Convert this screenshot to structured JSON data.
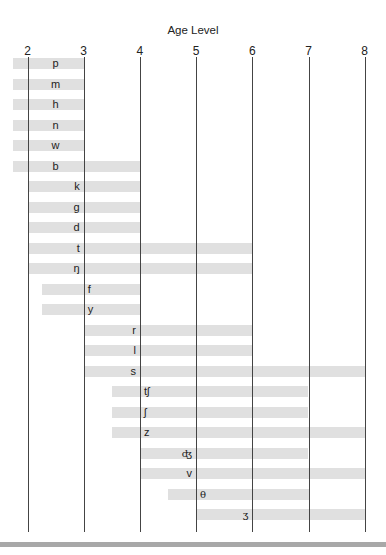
{
  "chart_data": {
    "type": "bar",
    "orientation": "horizontal-range",
    "title": "Age Level",
    "xlabel": "Age Level",
    "ylabel": "",
    "xlim": [
      1.75,
      8
    ],
    "x_ticks": [
      2,
      3,
      4,
      5,
      6,
      7,
      8
    ],
    "grid": "vertical lines at each tick",
    "legend": null,
    "bar_color": "#e0e0e0",
    "line_color": "#444444",
    "categories": [
      "p",
      "m",
      "h",
      "n",
      "w",
      "b",
      "k",
      "g",
      "d",
      "t",
      "ŋ",
      "f",
      "y",
      "r",
      "l",
      "s",
      "tʃ",
      "ʃ",
      "z",
      "ʤ",
      "v",
      "θ",
      "ʒ"
    ],
    "series": [
      {
        "name": "p",
        "start": 1.75,
        "end": 3,
        "label_x": 2.5,
        "label_align": "center"
      },
      {
        "name": "m",
        "start": 1.75,
        "end": 3,
        "label_x": 2.5,
        "label_align": "center"
      },
      {
        "name": "h",
        "start": 1.75,
        "end": 3,
        "label_x": 2.5,
        "label_align": "center"
      },
      {
        "name": "n",
        "start": 1.75,
        "end": 3,
        "label_x": 2.5,
        "label_align": "center"
      },
      {
        "name": "w",
        "start": 1.75,
        "end": 3,
        "label_x": 2.5,
        "label_align": "center"
      },
      {
        "name": "b",
        "start": 1.75,
        "end": 4,
        "label_x": 2.5,
        "label_align": "center"
      },
      {
        "name": "k",
        "start": 2,
        "end": 4,
        "label_x": 3,
        "label_align": "right"
      },
      {
        "name": "g",
        "start": 2,
        "end": 4,
        "label_x": 3,
        "label_align": "right"
      },
      {
        "name": "d",
        "start": 2,
        "end": 4,
        "label_x": 3,
        "label_align": "right"
      },
      {
        "name": "t",
        "start": 2,
        "end": 6,
        "label_x": 3,
        "label_align": "right"
      },
      {
        "name": "ŋ",
        "start": 2,
        "end": 6,
        "label_x": 3,
        "label_align": "right"
      },
      {
        "name": "f",
        "start": 2.25,
        "end": 4,
        "label_x": 3,
        "label_align": "left"
      },
      {
        "name": "y",
        "start": 2.25,
        "end": 4,
        "label_x": 3,
        "label_align": "left"
      },
      {
        "name": "r",
        "start": 3,
        "end": 6,
        "label_x": 4,
        "label_align": "right"
      },
      {
        "name": "l",
        "start": 3,
        "end": 6,
        "label_x": 4,
        "label_align": "right"
      },
      {
        "name": "s",
        "start": 3,
        "end": 8,
        "label_x": 4,
        "label_align": "right"
      },
      {
        "name": "tʃ",
        "start": 3.5,
        "end": 7,
        "label_x": 4,
        "label_align": "left"
      },
      {
        "name": "ʃ",
        "start": 3.5,
        "end": 7,
        "label_x": 4,
        "label_align": "left"
      },
      {
        "name": "z",
        "start": 3.5,
        "end": 8,
        "label_x": 4,
        "label_align": "left"
      },
      {
        "name": "ʤ",
        "start": 4,
        "end": 7,
        "label_x": 5,
        "label_align": "right"
      },
      {
        "name": "v",
        "start": 4,
        "end": 8,
        "label_x": 5,
        "label_align": "right"
      },
      {
        "name": "θ",
        "start": 4.5,
        "end": 7,
        "label_x": 5,
        "label_align": "left"
      },
      {
        "name": "ʒ",
        "start": 5,
        "end": 8,
        "label_x": 6,
        "label_align": "right"
      }
    ]
  }
}
